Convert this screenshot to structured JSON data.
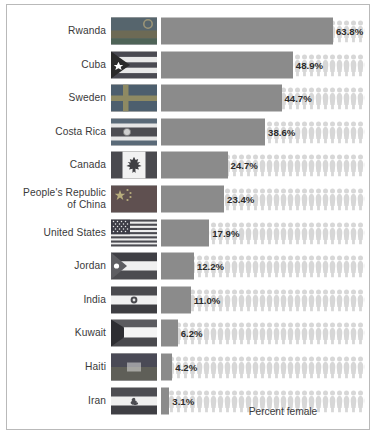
{
  "chart_data": {
    "type": "bar",
    "title": "",
    "xlabel": "Percent female",
    "ylabel": "",
    "xlim": [
      0,
      68
    ],
    "grid": false,
    "legend": null,
    "orientation": "horizontal",
    "value_suffix": "%",
    "categories": [
      "Rwanda",
      "Cuba",
      "Sweden",
      "Costa Rica",
      "Canada",
      "People's Republic of China",
      "United States",
      "Jordan",
      "India",
      "Kuwait",
      "Haiti",
      "Iran"
    ],
    "values": [
      63.8,
      48.9,
      44.7,
      38.6,
      24.7,
      23.4,
      17.9,
      12.2,
      11.0,
      6.2,
      4.2,
      3.1
    ],
    "labels": [
      "63.8%",
      "48.9%",
      "44.7%",
      "38.6%",
      "24.7%",
      "23.4%",
      "17.9%",
      "12.2%",
      "11.0%",
      "6.2%",
      "4.2%",
      "3.1%"
    ]
  },
  "axis": {
    "x_title": "Percent female"
  },
  "rows": [
    {
      "country": "Rwanda",
      "country_line1": "Rwanda",
      "country_line2": "",
      "value": "63.8%",
      "pct": 63.8,
      "flag": "flag-rwanda"
    },
    {
      "country": "Cuba",
      "country_line1": "Cuba",
      "country_line2": "",
      "value": "48.9%",
      "pct": 48.9,
      "flag": "flag-cuba"
    },
    {
      "country": "Sweden",
      "country_line1": "Sweden",
      "country_line2": "",
      "value": "44.7%",
      "pct": 44.7,
      "flag": "flag-sweden"
    },
    {
      "country": "Costa Rica",
      "country_line1": "Costa Rica",
      "country_line2": "",
      "value": "38.6%",
      "pct": 38.6,
      "flag": "flag-costa-rica"
    },
    {
      "country": "Canada",
      "country_line1": "Canada",
      "country_line2": "",
      "value": "24.7%",
      "pct": 24.7,
      "flag": "flag-canada"
    },
    {
      "country": "People's Republic of China",
      "country_line1": "People's Republic",
      "country_line2": "of China",
      "value": "23.4%",
      "pct": 23.4,
      "flag": "flag-china"
    },
    {
      "country": "United States",
      "country_line1": "United States",
      "country_line2": "",
      "value": "17.9%",
      "pct": 17.9,
      "flag": "flag-united-states"
    },
    {
      "country": "Jordan",
      "country_line1": "Jordan",
      "country_line2": "",
      "value": "12.2%",
      "pct": 12.2,
      "flag": "flag-jordan"
    },
    {
      "country": "India",
      "country_line1": "India",
      "country_line2": "",
      "value": "11.0%",
      "pct": 11.0,
      "flag": "flag-india"
    },
    {
      "country": "Kuwait",
      "country_line1": "Kuwait",
      "country_line2": "",
      "value": "6.2%",
      "pct": 6.2,
      "flag": "flag-kuwait"
    },
    {
      "country": "Haiti",
      "country_line1": "Haiti",
      "country_line2": "",
      "value": "4.2%",
      "pct": 4.2,
      "flag": "flag-haiti"
    },
    {
      "country": "Iran",
      "country_line1": "Iran",
      "country_line2": "",
      "value": "3.1%",
      "pct": 3.1,
      "flag": "flag-iran"
    }
  ],
  "colors": {
    "bar": "#8b8b8b",
    "person_icon": "#d7d7d7",
    "border": "#b9b9b9",
    "text": "#3a3a3a",
    "value_text": "#2b2b2b",
    "background": "#ffffff"
  }
}
